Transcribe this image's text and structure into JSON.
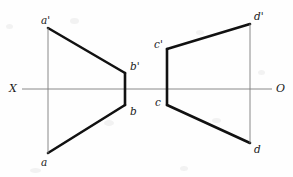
{
  "figure": {
    "background_color": "#fefefe",
    "stroke_color": "#111111",
    "thin_stroke_color": "#7d7d7d",
    "thick_width": 2.6,
    "thin_width": 0.9,
    "width": 293,
    "height": 177
  },
  "axis": {
    "name": "XO reference line",
    "y": 89,
    "x_start": 22,
    "x_end": 272,
    "left_label": "X",
    "right_label": "O",
    "left_label_x": 9,
    "left_label_y": 83,
    "right_label_x": 276,
    "right_label_y": 83
  },
  "points": {
    "a_prime": {
      "label": "a'",
      "x": 48,
      "y": 28,
      "label_x": 41,
      "label_y": 15
    },
    "a": {
      "label": "a",
      "x": 48,
      "y": 153,
      "label_x": 41,
      "label_y": 157
    },
    "b_prime": {
      "label": "b'",
      "x": 125,
      "y": 73,
      "label_x": 130,
      "label_y": 61
    },
    "b": {
      "label": "b",
      "x": 125,
      "y": 105,
      "label_x": 130,
      "label_y": 106
    },
    "c_prime": {
      "label": "c'",
      "x": 167,
      "y": 49,
      "label_x": 154,
      "label_y": 39
    },
    "c": {
      "label": "c",
      "x": 167,
      "y": 105,
      "label_x": 155,
      "label_y": 97
    },
    "d_prime": {
      "label": "d'",
      "x": 250,
      "y": 24,
      "label_x": 254,
      "label_y": 11
    },
    "d": {
      "label": "d",
      "x": 250,
      "y": 143,
      "label_x": 254,
      "label_y": 144
    }
  },
  "segments": [
    {
      "name": "a-prime-to-b-prime",
      "weight": "thick",
      "x1": 48,
      "y1": 28,
      "x2": 125,
      "y2": 73
    },
    {
      "name": "a-to-b",
      "weight": "thick",
      "x1": 48,
      "y1": 153,
      "x2": 125,
      "y2": 105
    },
    {
      "name": "b-prime-to-b",
      "weight": "thick",
      "x1": 125,
      "y1": 73,
      "x2": 125,
      "y2": 105
    },
    {
      "name": "a-prime-to-a",
      "weight": "thin",
      "x1": 48,
      "y1": 28,
      "x2": 48,
      "y2": 153
    },
    {
      "name": "c-prime-to-d-prime",
      "weight": "thick",
      "x1": 167,
      "y1": 49,
      "x2": 250,
      "y2": 24
    },
    {
      "name": "c-to-d",
      "weight": "thick",
      "x1": 167,
      "y1": 105,
      "x2": 250,
      "y2": 143
    },
    {
      "name": "c-prime-to-c",
      "weight": "thick",
      "x1": 167,
      "y1": 49,
      "x2": 167,
      "y2": 105
    },
    {
      "name": "d-prime-to-d",
      "weight": "thin",
      "x1": 250,
      "y1": 24,
      "x2": 250,
      "y2": 143
    }
  ],
  "specks": [
    {
      "x": 6,
      "y": 24,
      "w": 7,
      "h": 5
    },
    {
      "x": 70,
      "y": 18,
      "w": 9,
      "h": 6
    },
    {
      "x": 196,
      "y": 30,
      "w": 8,
      "h": 5
    },
    {
      "x": 104,
      "y": 120,
      "w": 10,
      "h": 6
    },
    {
      "x": 212,
      "y": 118,
      "w": 9,
      "h": 5
    },
    {
      "x": 30,
      "y": 168,
      "w": 11,
      "h": 5
    },
    {
      "x": 180,
      "y": 166,
      "w": 8,
      "h": 5
    },
    {
      "x": 258,
      "y": 70,
      "w": 7,
      "h": 5
    }
  ]
}
